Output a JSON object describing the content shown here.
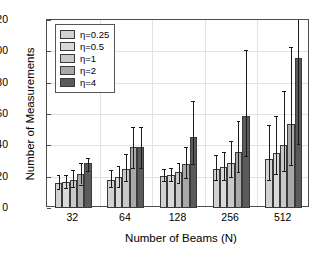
{
  "chart_data": {
    "type": "bar",
    "title": "",
    "subtitle": "",
    "xlabel": "Number of Beams (N)",
    "ylabel": "Number of Measurements",
    "categories": [
      "32",
      "64",
      "128",
      "256",
      "512"
    ],
    "ylim": [
      0,
      120
    ],
    "yticks": [
      0,
      20,
      40,
      60,
      80,
      100,
      120
    ],
    "grid": true,
    "legend_position": "top-left",
    "error_bars": "asymmetric (min/max whiskers with caps)",
    "series": [
      {
        "name": "η=0.25",
        "color": "#d2d2d2",
        "values": [
          16,
          18,
          20.5,
          25,
          31.5
        ],
        "err_low": [
          12,
          13.5,
          17,
          18,
          18
        ],
        "err_high": [
          21,
          24,
          25,
          34,
          53
        ]
      },
      {
        "name": "η=0.5",
        "color": "#d9d9d9",
        "values": [
          16.5,
          20,
          21,
          26,
          35
        ],
        "err_low": [
          13,
          13.5,
          17.5,
          18,
          21.5
        ],
        "err_high": [
          21,
          26.5,
          25.5,
          36,
          58.5
        ]
      },
      {
        "name": "η=1",
        "color": "#c9c9c9",
        "values": [
          18,
          25,
          23,
          28.5,
          40.5
        ],
        "err_low": [
          13.5,
          17,
          16,
          19.5,
          23.5
        ],
        "err_high": [
          24.5,
          34.5,
          28.5,
          43,
          75
        ]
      },
      {
        "name": "η=2",
        "color": "#a8a8a8",
        "values": [
          22,
          39,
          28,
          36,
          53.5
        ],
        "err_low": [
          15,
          25.5,
          19,
          23,
          27.5
        ],
        "err_high": [
          29,
          52,
          39,
          55.5,
          103
        ]
      },
      {
        "name": "η=4",
        "color": "#5a5a5a",
        "values": [
          28.5,
          39,
          45.5,
          58.5,
          96
        ],
        "err_low": [
          23.5,
          25.5,
          28,
          33.5,
          41
        ],
        "err_high": [
          32,
          52,
          68,
          101,
          120
        ]
      }
    ]
  }
}
